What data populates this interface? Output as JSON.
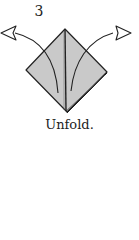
{
  "step": {
    "number": "3"
  },
  "caption": {
    "text": "Unfold."
  },
  "colors": {
    "paper_fill": "#c9c9c9",
    "line": "#222222",
    "background": "#ffffff"
  },
  "icons": {
    "left_arrow": "unfold-arrow-left",
    "right_arrow": "unfold-arrow-right"
  }
}
